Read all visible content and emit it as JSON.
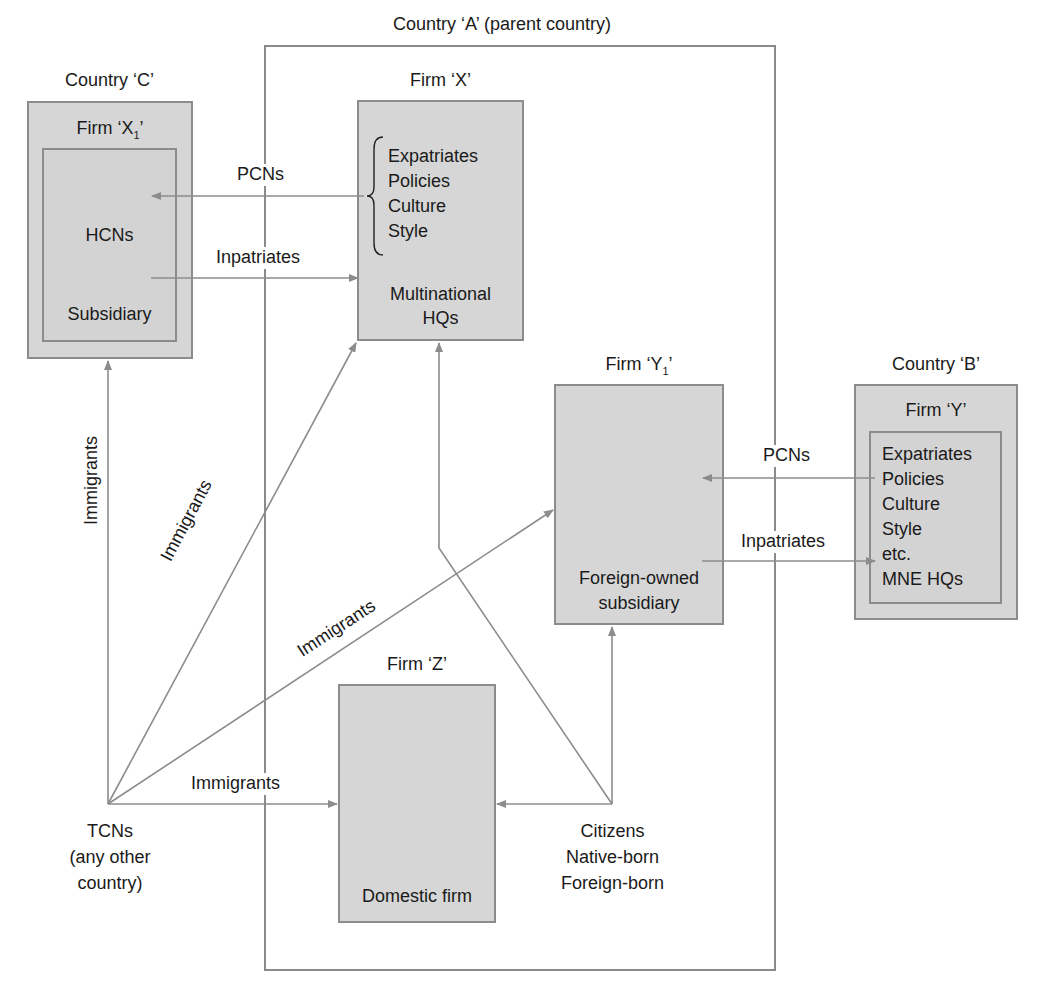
{
  "colors": {
    "box_fill": "#d6d6d6",
    "line": "#8c8c8c",
    "text": "#1a1a1a",
    "background": "#ffffff"
  },
  "country_a": {
    "label": "Country ‘A’ (parent country)"
  },
  "country_c": {
    "label": "Country ‘C’",
    "firm_label": "Firm ‘X",
    "firm_sub": "1",
    "firm_suffix": "’",
    "hcns": "HCNs",
    "subsidiary": "Subsidiary"
  },
  "firm_x": {
    "label": "Firm ‘X’",
    "items": [
      "Expatriates",
      "Policies",
      "Culture",
      "Style"
    ],
    "hq_line1": "Multinational",
    "hq_line2": "HQs"
  },
  "firm_y1": {
    "label": "Firm ‘Y",
    "label_sub": "1",
    "label_suffix": "’",
    "desc_line1": "Foreign-owned",
    "desc_line2": "subsidiary"
  },
  "country_b": {
    "label": "Country ‘B’",
    "firm_label": "Firm ‘Y’",
    "items": [
      "Expatriates",
      "Policies",
      "Culture",
      "Style",
      "etc.",
      "MNE HQs"
    ]
  },
  "firm_z": {
    "label": "Firm ‘Z’",
    "desc": "Domestic firm"
  },
  "tcns": {
    "line1": "TCNs",
    "line2": "(any other",
    "line3": "country)"
  },
  "citizens": {
    "line1": "Citizens",
    "line2": "Native-born",
    "line3": "Foreign-born"
  },
  "flows": {
    "pcns_x_to_x1": "PCNs",
    "inpatriates_x1_to_x": "Inpatriates",
    "pcns_y_to_y1": "PCNs",
    "inpatriates_y1_to_y": "Inpatriates",
    "immigrants_tcn_to_x1": "Immigrants",
    "immigrants_tcn_to_x": "Immigrants",
    "immigrants_tcn_to_y1": "Immigrants",
    "immigrants_tcn_to_z": "Immigrants"
  }
}
